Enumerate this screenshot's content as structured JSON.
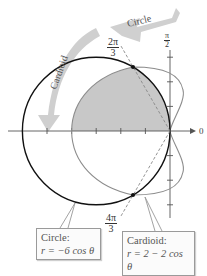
{
  "diagram": {
    "type": "polar-graph",
    "curves": [
      {
        "name": "Circle",
        "equation_label": "Circle:",
        "equation": "r = −6 cos θ",
        "color": "#111111"
      },
      {
        "name": "Cardioid",
        "equation_label": "Cardioid:",
        "equation": "r = 2 − 2 cos θ",
        "color": "#8a8a8a"
      }
    ],
    "shaded_region_color": "#c8c8c8",
    "intersection_angles": [
      {
        "num": "2π",
        "den": "3"
      },
      {
        "num": "4π",
        "den": "3"
      }
    ],
    "axis_labels": {
      "polar_axis": "0",
      "vertical_axis": {
        "num": "π",
        "den": "2"
      }
    },
    "arrows": [
      {
        "label": "Circle"
      },
      {
        "label": "Cardioid"
      }
    ],
    "arrow_color": "#c9c9c9"
  }
}
